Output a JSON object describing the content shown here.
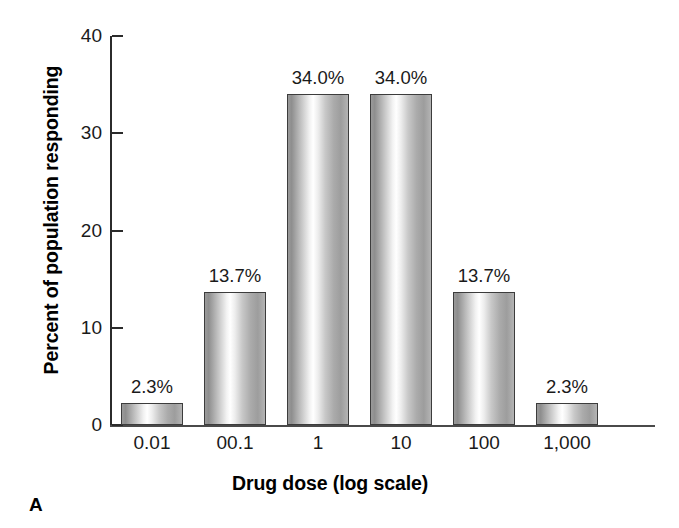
{
  "figure": {
    "panel_letter": "A"
  },
  "chart_data": {
    "type": "bar",
    "title": "",
    "subtitle": "",
    "xlabel": "Drug dose (log scale)",
    "ylabel": "Percent of population responding",
    "categories": [
      "0.01",
      "00.1",
      "1",
      "10",
      "100",
      "1,000"
    ],
    "values": [
      2.3,
      13.7,
      34.0,
      34.0,
      13.7,
      2.3
    ],
    "data_labels": [
      "2.3%",
      "13.7%",
      "34.0%",
      "34.0%",
      "13.7%",
      "2.3%"
    ],
    "ylim": [
      0,
      40
    ],
    "yticks": [
      0,
      10,
      20,
      30,
      40
    ],
    "ytick_labels": [
      "0",
      "10",
      "20",
      "30",
      "40"
    ],
    "grid": false,
    "legend": "none",
    "bar_fill": "#d9d9d9",
    "bar_edge": "#3c3c3c",
    "axis_color": "#2b2b2b"
  }
}
